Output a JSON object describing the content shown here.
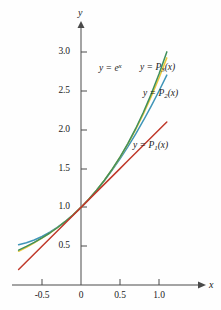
{
  "figure": {
    "axis_labels": {
      "x": "x",
      "y": "y"
    },
    "origin_label": "0"
  },
  "chart_data": {
    "type": "line",
    "title": "",
    "xlabel": "x",
    "ylabel": "y",
    "xlim": [
      -0.85,
      1.15
    ],
    "ylim": [
      -0.1,
      3.35
    ],
    "grid": false,
    "legend": "inline-annotations",
    "xticks": [
      -0.5,
      0,
      0.5,
      1.0
    ],
    "xtick_labels": [
      "-0.5",
      "0",
      "0.5",
      "1.0"
    ],
    "yticks": [
      0.5,
      1.0,
      1.5,
      2.0,
      2.5,
      3.0
    ],
    "ytick_labels": [
      "0.5",
      "1.0",
      "1.5",
      "2.0",
      "2.5",
      "3.0"
    ],
    "x": [
      -0.8,
      -0.7,
      -0.6,
      -0.5,
      -0.4,
      -0.3,
      -0.2,
      -0.1,
      0,
      0.1,
      0.2,
      0.3,
      0.4,
      0.5,
      0.6,
      0.7,
      0.8,
      0.9,
      1.0,
      1.1
    ],
    "series": [
      {
        "name": "y = e^x",
        "label": "y = e",
        "label_sup": "x",
        "color": "#3f8f5c",
        "values": [
          0.449,
          0.497,
          0.549,
          0.607,
          0.67,
          0.741,
          0.819,
          0.905,
          1.0,
          1.105,
          1.221,
          1.35,
          1.492,
          1.649,
          1.822,
          2.014,
          2.226,
          2.46,
          2.718,
          3.004
        ]
      },
      {
        "name": "y = P3(x)",
        "label": "y = P",
        "label_sub": "3",
        "label_tail": "(x)",
        "color": "#e8c83c",
        "values": [
          0.435,
          0.486,
          0.544,
          0.604,
          0.669,
          0.741,
          0.819,
          0.905,
          1.0,
          1.105,
          1.221,
          1.35,
          1.491,
          1.646,
          1.816,
          2.002,
          2.205,
          2.427,
          2.667,
          2.927
        ]
      },
      {
        "name": "y = P2(x)",
        "label": "y = P",
        "label_sub": "2",
        "label_tail": "(x)",
        "color": "#3f95b8",
        "values": [
          0.52,
          0.545,
          0.58,
          0.625,
          0.68,
          0.745,
          0.82,
          0.905,
          1.0,
          1.105,
          1.22,
          1.345,
          1.48,
          1.625,
          1.78,
          1.945,
          2.12,
          2.305,
          2.5,
          2.705
        ]
      },
      {
        "name": "y = P1(x)",
        "label": "y = P",
        "label_sub": "1",
        "label_tail": "(x)",
        "color": "#c0392b",
        "values": [
          0.2,
          0.3,
          0.4,
          0.5,
          0.6,
          0.7,
          0.8,
          0.9,
          1.0,
          1.1,
          1.2,
          1.3,
          1.4,
          1.5,
          1.6,
          1.7,
          1.8,
          1.9,
          2.0,
          2.1
        ]
      }
    ],
    "annotations": [
      {
        "text": "y = e^x",
        "x": 0.32,
        "y": 2.85
      },
      {
        "text": "y = P3(x)",
        "x": 0.7,
        "y": 2.86
      },
      {
        "text": "y = P2(x)",
        "x": 0.76,
        "y": 2.52
      },
      {
        "text": "y = P1(x)",
        "x": 0.62,
        "y": 1.93
      }
    ]
  },
  "ytick_labels": [
    "3.0",
    "2.5",
    "2.0",
    "1.5",
    "1.0",
    "0.5"
  ],
  "xtick_labels": [
    "-0.5",
    "0",
    "0.5",
    "1.0"
  ],
  "labels": {
    "exp": {
      "lhs": "y = e",
      "sup": "x"
    },
    "p3": {
      "lhs": "y = P",
      "sub": "3",
      "tail": "(x)"
    },
    "p2": {
      "lhs": "y = P",
      "sub": "2",
      "tail": "(x)"
    },
    "p1": {
      "lhs": "y = P",
      "sub": "1",
      "tail": "(x)"
    }
  }
}
